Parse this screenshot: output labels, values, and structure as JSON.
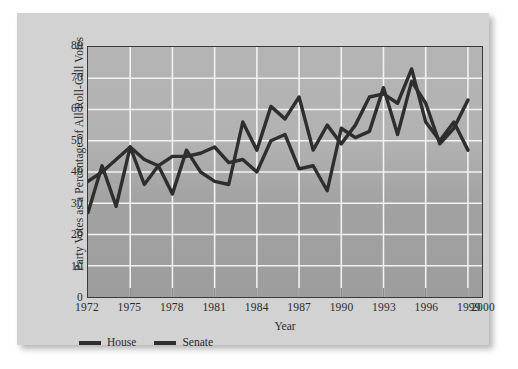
{
  "chart_data": {
    "type": "line",
    "title": "",
    "xlabel": "Year",
    "ylabel": "Party Votes as a Percentage of All Roll-Call Votes",
    "xlim": [
      1972,
      2000
    ],
    "ylim": [
      0,
      80
    ],
    "grid": true,
    "legend_position": "below-axis-left",
    "xticks": [
      "1972",
      "1975",
      "1978",
      "1981",
      "1984",
      "1987",
      "1990",
      "1993",
      "1996",
      "1999",
      "2000"
    ],
    "xtick_values": [
      1972,
      1975,
      1978,
      1981,
      1984,
      1987,
      1990,
      1993,
      1996,
      1999,
      2000
    ],
    "yticks": [
      "0",
      "10",
      "20",
      "30",
      "40",
      "50",
      "60",
      "70",
      "80"
    ],
    "ytick_values": [
      0,
      10,
      20,
      30,
      40,
      50,
      60,
      70,
      80
    ],
    "x": [
      1972,
      1973,
      1974,
      1975,
      1976,
      1977,
      1978,
      1979,
      1980,
      1981,
      1982,
      1983,
      1984,
      1985,
      1986,
      1987,
      1988,
      1989,
      1990,
      1991,
      1992,
      1993,
      1994,
      1995,
      1996,
      1997,
      1998,
      1999
    ],
    "series": [
      {
        "name": "House",
        "color": "#2e2e2e",
        "values": [
          27,
          42,
          29,
          48,
          36,
          42,
          33,
          47,
          40,
          37,
          36,
          56,
          47,
          61,
          57,
          64,
          47,
          55,
          49,
          55,
          64,
          65,
          62,
          73,
          56,
          50,
          56,
          47
        ]
      },
      {
        "name": "Senate",
        "color": "#2e2e2e",
        "values": [
          37,
          40,
          44,
          48,
          44,
          42,
          45,
          45,
          46,
          48,
          43,
          44,
          40,
          50,
          52,
          41,
          42,
          34,
          54,
          51,
          53,
          67,
          52,
          69,
          62,
          49,
          54,
          63
        ]
      }
    ],
    "legend": [
      {
        "label": "House",
        "swatch": "line-swatch"
      },
      {
        "label": "Senate",
        "swatch": "line-swatch"
      }
    ],
    "colors": {
      "line": "#2e2e2e",
      "gridline": "#f2f2f2",
      "plot_bg_top": "#b4b4b4",
      "plot_bg_bottom": "#9d9d9d",
      "card_bg": "#d2d2d2",
      "frame": "#3a3a3a",
      "page_bg": "#ffffff",
      "text": "#2b2b2b"
    }
  }
}
